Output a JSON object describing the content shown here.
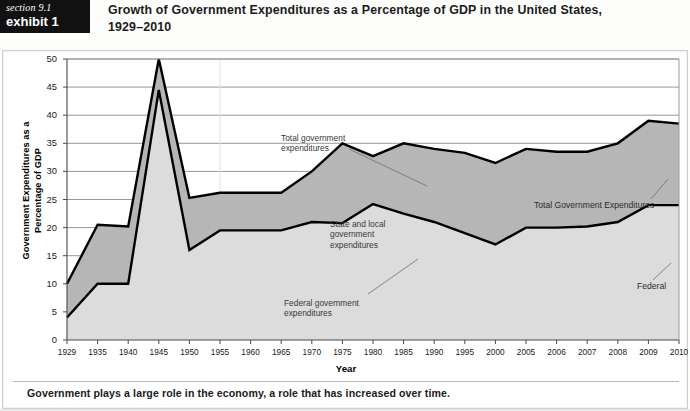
{
  "header": {
    "badge_section": "section 9.1",
    "badge_exhibit": "exhibit 1",
    "title": "Growth of Government Expenditures as a Percentage of GDP in the United States, 1929–2010"
  },
  "caption": "Government plays a large role in the economy, a role that has increased over time.",
  "annotations": {
    "total_gov": "Total government\nexpenditures",
    "state_local": "State and local\ngovernment\nexpenditures",
    "federal_gov": "Federal government\nexpenditures",
    "total_right": "Total Government Expenditures",
    "federal_right": "Federal"
  },
  "colors": {
    "total_area": "#b6b6b6",
    "federal_area": "#dcdcdc",
    "line": "#000000",
    "grid": "#8c8c8c",
    "badge_bg": "#111111"
  },
  "chart_data": {
    "type": "area",
    "title": "Growth of Government Expenditures as a Percentage of GDP in the United States, 1929–2010",
    "xlabel": "Year",
    "ylabel": "Government Expenditures as a Percentage of GDP",
    "ylim": [
      0,
      50
    ],
    "yticks": [
      0,
      5,
      10,
      15,
      20,
      25,
      30,
      35,
      40,
      45,
      50
    ],
    "grid": true,
    "legend_position": "inline-annotations",
    "categories": [
      "1929",
      "1935",
      "1940",
      "1945",
      "1950",
      "1955",
      "1960",
      "1965",
      "1970",
      "1975",
      "1980",
      "1985",
      "1990",
      "1995",
      "2000",
      "2005",
      "2006",
      "2007",
      "2008",
      "2009",
      "2010"
    ],
    "series": [
      {
        "name": "Total government expenditures",
        "values": [
          10.0,
          20.5,
          20.2,
          50.0,
          25.3,
          26.2,
          26.2,
          26.2,
          30.0,
          35.0,
          32.7,
          35.0,
          34.0,
          33.3,
          31.5,
          34.0,
          33.5,
          33.5,
          35.0,
          39.0,
          38.5
        ]
      },
      {
        "name": "Federal government expenditures",
        "values": [
          4.0,
          10.0,
          10.0,
          44.5,
          16.0,
          19.5,
          19.5,
          19.5,
          21.0,
          20.8,
          24.2,
          22.5,
          21.0,
          19.0,
          17.0,
          20.0,
          20.0,
          20.2,
          21.0,
          24.0,
          24.0
        ]
      }
    ],
    "note": "Shaded band between the two lines represents state and local government expenditures."
  }
}
